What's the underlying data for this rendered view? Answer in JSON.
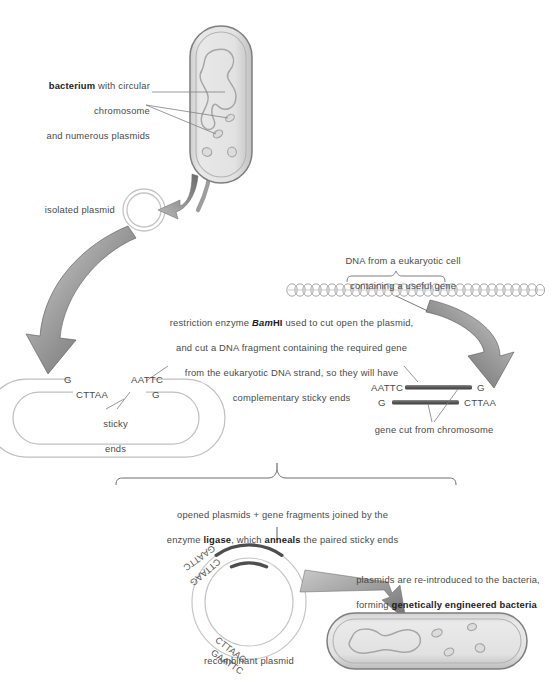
{
  "figure": {
    "background": "#ffffff",
    "ink": "#4a4a4a",
    "accent_gray": "#8a8a8a",
    "cell_fill": "#e3e3e3",
    "cell_stroke": "#9a9a9a"
  },
  "labels": {
    "bacterium": {
      "line1_bold": "bacterium",
      "line1_rest": " with circular",
      "line2": "chromosome",
      "line3": "and numerous plasmids"
    },
    "isolated_plasmid": "isolated plasmid",
    "eukaryotic_dna": {
      "line1": "DNA from a eukaryotic cell",
      "line2": "containing a useful gene"
    },
    "restriction": {
      "line1_a": "restriction enzyme ",
      "line1_bam": "Bam",
      "line1_hi": "HI",
      "line1_b": " used to cut open the plasmid,",
      "line2": "and cut a DNA fragment containing the required gene",
      "line3": "from the eukaryotic DNA strand, so they will have",
      "line4": "complementary sticky ends"
    },
    "sticky_ends": {
      "line1": "sticky",
      "line2": "ends"
    },
    "gene_cut": "gene cut from chromosome",
    "ligase": {
      "line1": "opened plasmids + gene fragments joined by the",
      "line2_a": "enzyme ",
      "line2_ligase": "ligase",
      "line2_b": ", which ",
      "line2_anneals": "anneals",
      "line2_c": " the paired sticky ends"
    },
    "recombinant_plasmid": "recombinant plasmid",
    "reintroduce": {
      "line1": "plasmids are re-introduced to the bacteria,",
      "line2_a": "forming ",
      "line2_bold": "genetically engineered bacteria"
    }
  },
  "sequences": {
    "plasmid_open": {
      "left_top": "G",
      "left_bottom": "CTTAA",
      "right_top": "AATTC",
      "right_bottom": "G"
    },
    "gene_fragment": {
      "left_top": "AATTC",
      "right_top": "G",
      "left_bottom": "G",
      "right_bottom": "CTTAA"
    },
    "recombinant": {
      "left_outer": "GAATTC",
      "left_inner": "CTTAAG",
      "right_outer": "GAATTC",
      "right_inner": "CTTAAG"
    }
  },
  "icons": {
    "bacterium_top": "bacterium-capsule-icon",
    "bacterium_bottom": "bacterium-capsule-icon",
    "chromosome": "chromosome-loop-icon",
    "plasmid_ring": "plasmid-ring-icon",
    "dna_strand": "dna-double-helix-icon",
    "arrow_left": "curved-arrow-icon",
    "arrow_right": "curved-arrow-icon",
    "arrow_down": "curved-arrow-icon",
    "arrow_insert": "wedge-arrow-icon",
    "bracket": "curly-bracket-icon"
  }
}
